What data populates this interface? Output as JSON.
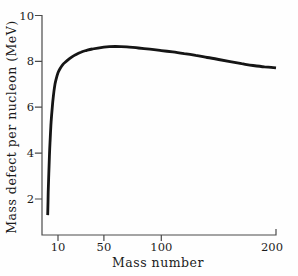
{
  "figure": {
    "background": "#fefefe",
    "curve_color": "#151515",
    "axis_color": "#4a4a4a",
    "text_color": "#1c1c1c"
  },
  "chart_data": {
    "type": "line",
    "title": "",
    "xlabel": "Mass number",
    "ylabel": "Mass defect per nucleon (MeV)",
    "xlim": [
      0,
      200
    ],
    "ylim": [
      0,
      10
    ],
    "xticks": [
      10,
      50,
      100,
      200
    ],
    "yticks": [
      10,
      8,
      6,
      4,
      2
    ],
    "grid": false,
    "legend": null,
    "series": [
      {
        "name": "mass-defect-per-nucleon-curve",
        "points": [
          [
            1,
            1.3
          ],
          [
            1.5,
            2.3
          ],
          [
            2,
            3.1
          ],
          [
            2.5,
            3.85
          ],
          [
            3,
            4.45
          ],
          [
            4,
            5.35
          ],
          [
            5,
            6.0
          ],
          [
            6,
            6.5
          ],
          [
            7,
            6.9
          ],
          [
            8,
            7.15
          ],
          [
            10,
            7.5
          ],
          [
            12,
            7.7
          ],
          [
            14,
            7.85
          ],
          [
            16,
            7.95
          ],
          [
            20,
            8.12
          ],
          [
            25,
            8.28
          ],
          [
            30,
            8.4
          ],
          [
            35,
            8.48
          ],
          [
            40,
            8.54
          ],
          [
            50,
            8.62
          ],
          [
            60,
            8.65
          ],
          [
            70,
            8.63
          ],
          [
            80,
            8.58
          ],
          [
            90,
            8.53
          ],
          [
            100,
            8.47
          ],
          [
            110,
            8.41
          ],
          [
            120,
            8.34
          ],
          [
            130,
            8.26
          ],
          [
            140,
            8.17
          ],
          [
            150,
            8.08
          ],
          [
            160,
            7.99
          ],
          [
            170,
            7.9
          ],
          [
            180,
            7.82
          ],
          [
            190,
            7.76
          ],
          [
            200,
            7.72
          ]
        ]
      }
    ]
  }
}
